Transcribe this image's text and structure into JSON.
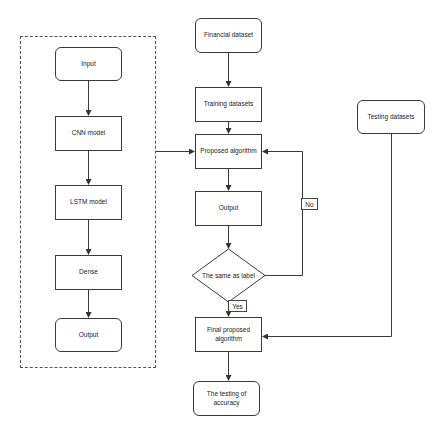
{
  "diagram": {
    "model_group": {
      "nodes": [
        {
          "id": "input",
          "label": "Input",
          "shape": "rounded"
        },
        {
          "id": "cnn",
          "label": "CNN model",
          "shape": "rect"
        },
        {
          "id": "lstm",
          "label": "LSTM model",
          "shape": "rect"
        },
        {
          "id": "dense",
          "label": "Dense",
          "shape": "rect"
        },
        {
          "id": "output_model",
          "label": "Output",
          "shape": "rounded"
        }
      ]
    },
    "main_flow": {
      "financial": {
        "label": "Financial dataset",
        "shape": "rounded"
      },
      "training": {
        "label": "Training datasets",
        "shape": "rect"
      },
      "proposed": {
        "label": "Proposed algorithm",
        "shape": "rect"
      },
      "output": {
        "label": "Output",
        "shape": "rect"
      },
      "decision": {
        "label": "The same as label",
        "shape": "diamond"
      },
      "final": {
        "label": "Final proposed algorithm",
        "shape": "rect"
      },
      "accuracy": {
        "label": "The testing of accuracy",
        "shape": "rounded"
      }
    },
    "testing": {
      "label": "Testing datasets",
      "shape": "rounded"
    },
    "edge_labels": {
      "no": "No",
      "yes": "Yes"
    },
    "edges": [
      {
        "from": "input",
        "to": "cnn"
      },
      {
        "from": "cnn",
        "to": "lstm"
      },
      {
        "from": "lstm",
        "to": "dense"
      },
      {
        "from": "dense",
        "to": "output_model"
      },
      {
        "from": "model_group",
        "to": "proposed"
      },
      {
        "from": "financial",
        "to": "training"
      },
      {
        "from": "training",
        "to": "proposed"
      },
      {
        "from": "proposed",
        "to": "output"
      },
      {
        "from": "output",
        "to": "decision"
      },
      {
        "from": "decision",
        "to": "proposed",
        "label": "No"
      },
      {
        "from": "decision",
        "to": "final",
        "label": "Yes"
      },
      {
        "from": "testing",
        "to": "final"
      },
      {
        "from": "final",
        "to": "accuracy"
      }
    ],
    "colors": {
      "stroke": "#3a3a3a",
      "background": "#ffffff",
      "text": "#222222"
    }
  }
}
